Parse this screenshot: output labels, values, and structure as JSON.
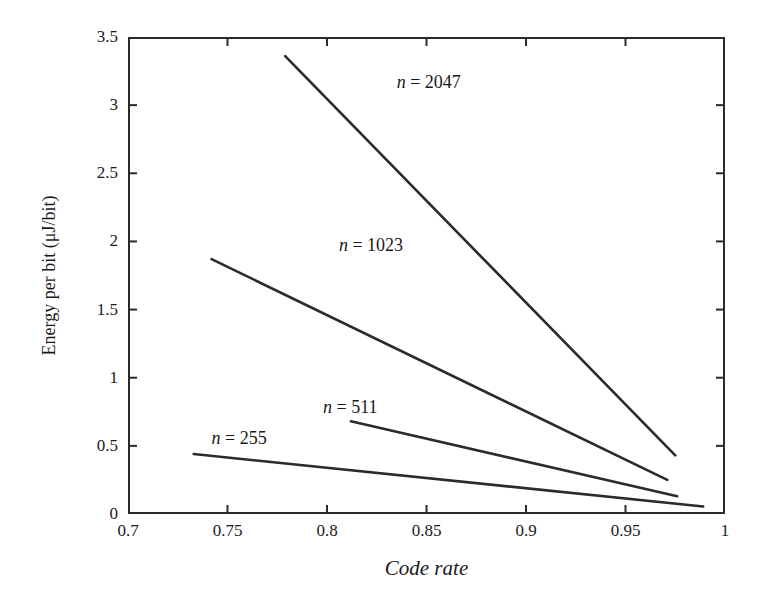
{
  "chart_data": {
    "type": "line",
    "title": "",
    "subtitle": "",
    "xlabel": "Code rate",
    "ylabel": "Energy per bit (μJ/bit)",
    "xlim": [
      0.7,
      1.0
    ],
    "ylim": [
      0,
      3.5
    ],
    "xticks": [
      "0.7",
      "0.75",
      "0.8",
      "0.85",
      "0.9",
      "0.95",
      "1"
    ],
    "xtick_values": [
      0.7,
      0.75,
      0.8,
      0.85,
      0.9,
      0.95,
      1.0
    ],
    "yticks": [
      "0",
      "0.5",
      "1",
      "1.5",
      "2",
      "2.5",
      "3",
      "3.5"
    ],
    "ytick_values": [
      0,
      0.5,
      1,
      1.5,
      2,
      2.5,
      3,
      3.5
    ],
    "grid": false,
    "legend_position": "inline-annotations",
    "line_color": "#2b2b2b",
    "axis_color": "#2b2b2b",
    "background": "#ffffff",
    "series": [
      {
        "name": "n = 2047",
        "label_prefix": "n",
        "label_suffix": " = 2047",
        "x": [
          0.779,
          0.975
        ],
        "y": [
          3.36,
          0.43
        ],
        "annotation": {
          "text": "n = 2047",
          "x": 0.835,
          "y": 3.16
        }
      },
      {
        "name": "n = 1023",
        "label_prefix": "n",
        "label_suffix": " = 1023",
        "x": [
          0.742,
          0.971
        ],
        "y": [
          1.87,
          0.25
        ],
        "annotation": {
          "text": "n = 1023",
          "x": 0.806,
          "y": 1.97
        }
      },
      {
        "name": "n = 511",
        "label_prefix": "n",
        "label_suffix": " = 511",
        "x": [
          0.812,
          0.976
        ],
        "y": [
          0.68,
          0.13
        ],
        "annotation": {
          "text": "n = 511",
          "x": 0.798,
          "y": 0.78
        }
      },
      {
        "name": "n = 255",
        "label_prefix": "n",
        "label_suffix": " = 255",
        "x": [
          0.733,
          0.989
        ],
        "y": [
          0.44,
          0.055
        ],
        "annotation": {
          "text": "n = 255",
          "x": 0.742,
          "y": 0.55
        }
      }
    ]
  }
}
